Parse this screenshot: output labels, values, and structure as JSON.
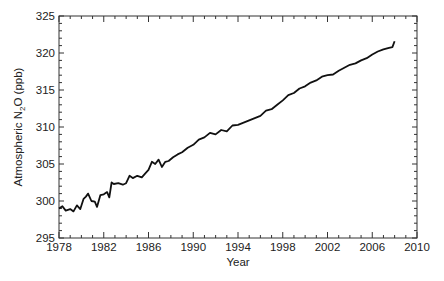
{
  "chart_data": {
    "type": "line",
    "title": "",
    "xlabel": "Year",
    "ylabel": "Atmospheric N2O (ppb)",
    "ylabel_parts": {
      "prefix": "Atmospheric N",
      "subscript": "2",
      "suffix": "O (ppb)"
    },
    "xlim": [
      1978,
      2010
    ],
    "ylim": [
      295,
      325
    ],
    "xticks": [
      1978,
      1982,
      1986,
      1990,
      1994,
      1998,
      2002,
      2006,
      2010
    ],
    "yticks": [
      295,
      300,
      305,
      310,
      315,
      320,
      325
    ],
    "x_minor_step": 1,
    "y_minor_step": 1,
    "grid": false,
    "legend": null,
    "series": [
      {
        "name": "Atmospheric N2O",
        "color": "#111111",
        "x": [
          1978.0,
          1978.3,
          1978.6,
          1979.0,
          1979.3,
          1979.6,
          1979.9,
          1980.2,
          1980.4,
          1980.6,
          1980.9,
          1981.2,
          1981.4,
          1981.7,
          1982.0,
          1982.3,
          1982.5,
          1982.7,
          1982.9,
          1983.3,
          1983.7,
          1984.0,
          1984.3,
          1984.6,
          1985.0,
          1985.4,
          1985.7,
          1986.0,
          1986.3,
          1986.6,
          1986.9,
          1987.2,
          1987.5,
          1987.8,
          1988.2,
          1988.6,
          1989.0,
          1989.5,
          1990.0,
          1990.5,
          1991.0,
          1991.5,
          1992.0,
          1992.5,
          1993.0,
          1993.5,
          1994.0,
          1994.5,
          1995.0,
          1995.5,
          1996.0,
          1996.5,
          1997.0,
          1997.5,
          1998.0,
          1998.5,
          1999.0,
          1999.5,
          2000.0,
          2000.5,
          2001.0,
          2001.5,
          2002.0,
          2002.5,
          2003.0,
          2003.5,
          2004.0,
          2004.5,
          2005.0,
          2005.5,
          2006.0,
          2006.5,
          2007.0,
          2007.5,
          2007.8,
          2008.0
        ],
        "values": [
          299.0,
          299.3,
          298.7,
          298.9,
          298.6,
          299.4,
          298.9,
          300.3,
          300.6,
          301.0,
          300.0,
          299.9,
          299.2,
          300.8,
          300.9,
          301.2,
          300.5,
          302.5,
          302.3,
          302.4,
          302.2,
          302.4,
          303.4,
          303.1,
          303.4,
          303.2,
          303.7,
          304.2,
          305.3,
          305.0,
          305.6,
          304.6,
          305.3,
          305.4,
          305.9,
          306.3,
          306.6,
          307.2,
          307.6,
          308.3,
          308.6,
          309.2,
          309.0,
          309.6,
          309.4,
          310.2,
          310.3,
          310.6,
          310.9,
          311.2,
          311.5,
          312.2,
          312.4,
          313.0,
          313.6,
          314.3,
          314.6,
          315.2,
          315.5,
          316.0,
          316.3,
          316.8,
          317.0,
          317.1,
          317.6,
          318.0,
          318.4,
          318.6,
          319.0,
          319.3,
          319.8,
          320.2,
          320.5,
          320.7,
          320.8,
          321.6
        ]
      }
    ]
  }
}
